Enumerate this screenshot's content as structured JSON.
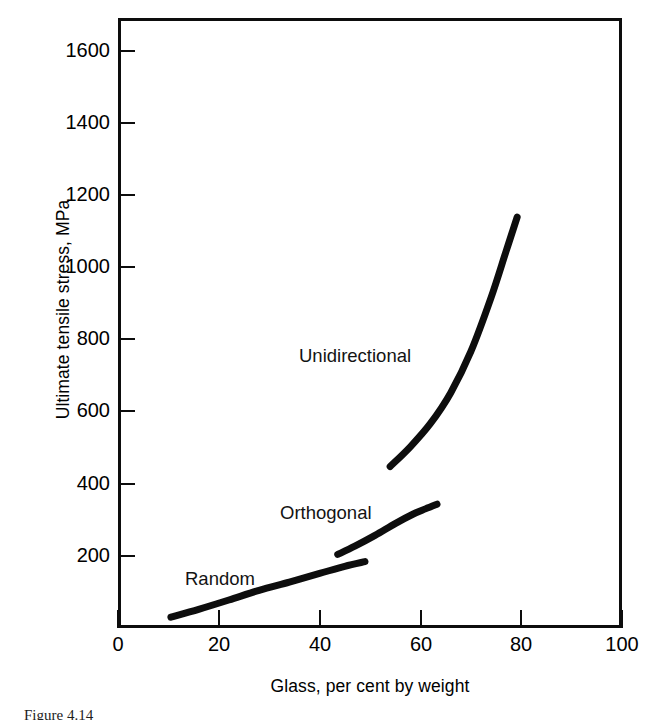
{
  "figure": {
    "background_color": "#ffffff",
    "ink_color": "#0d0d0d",
    "caption_partial": "Figure 4.14"
  },
  "chart_data": {
    "type": "line",
    "title": "",
    "subtitle": "",
    "xlabel": "Glass, per cent by weight",
    "ylabel": "Ultimate tensile stress, MPa",
    "xlim": [
      0,
      100
    ],
    "ylim": [
      0,
      1700
    ],
    "xticks": [
      0,
      20,
      40,
      60,
      80,
      100
    ],
    "xtick_labels": [
      "0",
      "20",
      "40",
      "60",
      "80",
      "100"
    ],
    "yticks": [
      200,
      400,
      600,
      800,
      1000,
      1200,
      1400,
      1600
    ],
    "ytick_labels": [
      "200",
      "400",
      "600",
      "800",
      "1000",
      "1200",
      "1400",
      "1600"
    ],
    "grid": false,
    "legend_position": "inline-annotations",
    "annotations": [
      {
        "text": "Unidirectional",
        "x": 36,
        "y": 745
      },
      {
        "text": "Orthogonal",
        "x": 32,
        "y": 315
      },
      {
        "text": "Random",
        "x": 13,
        "y": 145
      }
    ],
    "series": [
      {
        "name": "Random",
        "color": "#0d0d0d",
        "x": [
          10.5,
          16,
          22,
          28,
          34,
          40,
          45,
          49
        ],
        "values": [
          30,
          52,
          78,
          105,
          128,
          152,
          172,
          185
        ]
      },
      {
        "name": "Orthogonal",
        "color": "#0d0d0d",
        "x": [
          43.6,
          47,
          51,
          55,
          58.5,
          61,
          63.3
        ],
        "values": [
          205,
          228,
          258,
          291,
          317,
          332,
          345
        ]
      },
      {
        "name": "Unidirectional",
        "color": "#0d0d0d",
        "x": [
          54,
          58,
          62,
          66,
          70,
          74,
          77,
          79.2
        ],
        "values": [
          450,
          505,
          570,
          655,
          770,
          920,
          1050,
          1145
        ]
      }
    ]
  },
  "axes": {
    "y_label": "Ultimate tensile stress, MPa",
    "x_label": "Glass, per cent by weight",
    "y_tick_labels": [
      "1600",
      "1400",
      "1200",
      "1000",
      "800",
      "600",
      "400",
      "200"
    ],
    "x_tick_labels": [
      "0",
      "20",
      "40",
      "60",
      "80",
      "100"
    ]
  },
  "series_labels": {
    "unidirectional": "Unidirectional",
    "orthogonal": "Orthogonal",
    "random": "Random"
  }
}
